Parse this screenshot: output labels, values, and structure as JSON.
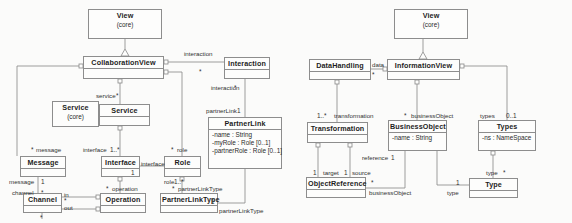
{
  "figure": {
    "kind": "uml-class-diagram",
    "panels": [
      "collaboration-view-panel",
      "information-view-panel"
    ],
    "colors": {
      "background": "#fbfbfa",
      "box_fill": "#fdfdfc",
      "line": "#8d8d8d",
      "text": "#2b2b2b"
    }
  },
  "left_panel": {
    "classes": [
      {
        "id": "view-core-left",
        "name": "View",
        "stereotype": "(core)",
        "attributes": [],
        "x": 88,
        "y": 9,
        "w": 74,
        "h": 30
      },
      {
        "id": "collaboration-view",
        "name": "CollaborationView",
        "stereotype": "",
        "attributes": [],
        "x": 83,
        "y": 56,
        "w": 81,
        "h": 23
      },
      {
        "id": "interaction",
        "name": "Interaction",
        "stereotype": "",
        "attributes": [],
        "x": 224,
        "y": 57,
        "w": 46,
        "h": 22
      },
      {
        "id": "service-core",
        "name": "Service",
        "stereotype": "(core)",
        "attributes": [],
        "x": 52,
        "y": 101,
        "w": 47,
        "h": 26
      },
      {
        "id": "service",
        "name": "Service",
        "stereotype": "",
        "attributes": [],
        "x": 99,
        "y": 104,
        "w": 51,
        "h": 22
      },
      {
        "id": "partner-link",
        "name": "PartnerLink",
        "stereotype": "",
        "attributes": [
          "-name : String",
          "-myRole : Role [0..1]",
          "-partnerRole : Role [0..1]"
        ],
        "x": 208,
        "y": 117,
        "w": 74,
        "h": 52
      },
      {
        "id": "message",
        "name": "Message",
        "stereotype": "",
        "attributes": [],
        "x": 20,
        "y": 156,
        "w": 46,
        "h": 21
      },
      {
        "id": "interface",
        "name": "Interface",
        "stereotype": "",
        "attributes": [],
        "x": 101,
        "y": 156,
        "w": 39,
        "h": 21
      },
      {
        "id": "role",
        "name": "Role",
        "stereotype": "",
        "attributes": [],
        "x": 164,
        "y": 156,
        "w": 37,
        "h": 21
      },
      {
        "id": "channel",
        "name": "Channel",
        "stereotype": "",
        "attributes": [],
        "x": 23,
        "y": 193,
        "w": 39,
        "h": 20
      },
      {
        "id": "operation",
        "name": "Operation",
        "stereotype": "",
        "attributes": [],
        "x": 100,
        "y": 193,
        "w": 46,
        "h": 20
      },
      {
        "id": "partner-link-type",
        "name": "PartnerLinkType",
        "stereotype": "",
        "attributes": [],
        "x": 160,
        "y": 193,
        "w": 58,
        "h": 20
      }
    ],
    "edge_labels": [
      {
        "id": "lbl-interaction-role",
        "text": "interaction",
        "x": 184,
        "y": 50
      },
      {
        "id": "lbl-interaction-assoc",
        "text": "interaction",
        "x": 211,
        "y": 84
      },
      {
        "id": "lbl-service-role",
        "text": "service",
        "x": 96,
        "y": 92
      },
      {
        "id": "lbl-partnerlink-role",
        "text": "partnerLink",
        "x": 206,
        "y": 107
      },
      {
        "id": "lbl-message-role",
        "text": "message",
        "x": 36,
        "y": 146
      },
      {
        "id": "lbl-interface-role",
        "text": "interface",
        "x": 83,
        "y": 146
      },
      {
        "id": "lbl-role-role",
        "text": "role",
        "x": 177,
        "y": 146
      },
      {
        "id": "lbl-interface-end",
        "text": "interface",
        "x": 141,
        "y": 160
      },
      {
        "id": "lbl-message-end",
        "text": "message",
        "x": 9,
        "y": 178
      },
      {
        "id": "lbl-role-end",
        "text": "role",
        "x": 164,
        "y": 178
      },
      {
        "id": "lbl-channel-end",
        "text": "channel",
        "x": 12,
        "y": 189
      },
      {
        "id": "lbl-operation-role",
        "text": "operation",
        "x": 112,
        "y": 185
      },
      {
        "id": "lbl-partnerlinktype-role",
        "text": "partnerLinkType",
        "x": 178,
        "y": 185
      },
      {
        "id": "lbl-in",
        "text": "in",
        "x": 64,
        "y": 191
      },
      {
        "id": "lbl-out",
        "text": "out",
        "x": 64,
        "y": 205
      },
      {
        "id": "lbl-partnerlinktype-end",
        "text": "partnerLinkType",
        "x": 219,
        "y": 208
      }
    ],
    "multiplicities": [
      {
        "id": "m-interaction-star",
        "text": "*",
        "x": 199,
        "y": 68
      },
      {
        "id": "m-interaction-star2",
        "text": "*",
        "x": 234,
        "y": 84
      },
      {
        "id": "m-service-star",
        "text": "*",
        "x": 116,
        "y": 92
      },
      {
        "id": "m-partnerlink-1",
        "text": "1",
        "x": 237,
        "y": 107
      },
      {
        "id": "m-message-star",
        "text": "*",
        "x": 31,
        "y": 146
      },
      {
        "id": "m-interface-1star",
        "text": "1..*",
        "x": 110,
        "y": 146
      },
      {
        "id": "m-role-star",
        "text": "*",
        "x": 171,
        "y": 146
      },
      {
        "id": "m-interface-1",
        "text": "1",
        "x": 131,
        "y": 170
      },
      {
        "id": "m-message-1",
        "text": "1",
        "x": 41,
        "y": 178
      },
      {
        "id": "m-role-1star",
        "text": "1..*",
        "x": 174,
        "y": 178
      },
      {
        "id": "m-channel-star",
        "text": "*",
        "x": 41,
        "y": 189
      },
      {
        "id": "m-operation-star",
        "text": "*",
        "x": 106,
        "y": 185
      },
      {
        "id": "m-plt-star",
        "text": "*",
        "x": 172,
        "y": 185
      },
      {
        "id": "m-channel-star2",
        "text": "*",
        "x": 64,
        "y": 198
      },
      {
        "id": "m-channel-star3",
        "text": "*",
        "x": 41,
        "y": 215
      },
      {
        "id": "m-plt-1",
        "text": "1",
        "x": 211,
        "y": 199
      }
    ]
  },
  "right_panel": {
    "classes": [
      {
        "id": "view-core-right",
        "name": "View",
        "stereotype": "(core)",
        "attributes": [],
        "x": 394,
        "y": 9,
        "w": 74,
        "h": 30
      },
      {
        "id": "data-handling",
        "name": "DataHandling",
        "stereotype": "",
        "attributes": [],
        "x": 309,
        "y": 59,
        "w": 62,
        "h": 21
      },
      {
        "id": "information-view",
        "name": "InformationView",
        "stereotype": "",
        "attributes": [],
        "x": 387,
        "y": 59,
        "w": 73,
        "h": 21
      },
      {
        "id": "transformation",
        "name": "Transformation",
        "stereotype": "",
        "attributes": [],
        "x": 307,
        "y": 122,
        "w": 61,
        "h": 21
      },
      {
        "id": "business-object",
        "name": "BusinessObject",
        "stereotype": "",
        "attributes": [
          "-name : String"
        ],
        "x": 388,
        "y": 120,
        "w": 59,
        "h": 31
      },
      {
        "id": "types",
        "name": "Types",
        "stereotype": "",
        "attributes": [
          "-ns : NameSpace"
        ],
        "x": 478,
        "y": 120,
        "w": 58,
        "h": 31
      },
      {
        "id": "object-reference",
        "name": "ObjectReference",
        "stereotype": "",
        "attributes": [],
        "x": 306,
        "y": 177,
        "w": 60,
        "h": 21
      },
      {
        "id": "type",
        "name": "Type",
        "stereotype": "",
        "attributes": [],
        "x": 469,
        "y": 178,
        "w": 49,
        "h": 20
      }
    ],
    "edge_labels": [
      {
        "id": "lbl-data-role",
        "text": "data",
        "x": 372,
        "y": 62
      },
      {
        "id": "lbl-transformation-role",
        "text": "transformation",
        "x": 334,
        "y": 112
      },
      {
        "id": "lbl-businessobject-role",
        "text": "businessObject",
        "x": 411,
        "y": 112
      },
      {
        "id": "lbl-types-role",
        "text": "types",
        "x": 480,
        "y": 112
      },
      {
        "id": "lbl-reference-role",
        "text": "reference",
        "x": 362,
        "y": 155
      },
      {
        "id": "lbl-target-role",
        "text": "target",
        "x": 323,
        "y": 170
      },
      {
        "id": "lbl-source-role",
        "text": "source",
        "x": 352,
        "y": 170
      },
      {
        "id": "lbl-type-role",
        "text": "type",
        "x": 486,
        "y": 170
      },
      {
        "id": "lbl-businessobject-end",
        "text": "businessObject",
        "x": 369,
        "y": 190
      },
      {
        "id": "lbl-type-end",
        "text": "type",
        "x": 447,
        "y": 190
      }
    ],
    "multiplicities": [
      {
        "id": "m-data-star",
        "text": "*",
        "x": 372,
        "y": 72
      },
      {
        "id": "m-transformation-1star",
        "text": "1..*",
        "x": 318,
        "y": 112
      },
      {
        "id": "m-businessobject-star",
        "text": "*",
        "x": 404,
        "y": 112
      },
      {
        "id": "m-types-01",
        "text": "0..1",
        "x": 506,
        "y": 112
      },
      {
        "id": "m-reference-1",
        "text": "1",
        "x": 391,
        "y": 155
      },
      {
        "id": "m-target-1",
        "text": "1",
        "x": 313,
        "y": 170
      },
      {
        "id": "m-source-1",
        "text": "1",
        "x": 344,
        "y": 170
      },
      {
        "id": "m-type-star",
        "text": "*",
        "x": 503,
        "y": 170
      },
      {
        "id": "m-objref-star",
        "text": "*",
        "x": 371,
        "y": 180
      },
      {
        "id": "m-type-1",
        "text": "1",
        "x": 456,
        "y": 180
      }
    ]
  }
}
